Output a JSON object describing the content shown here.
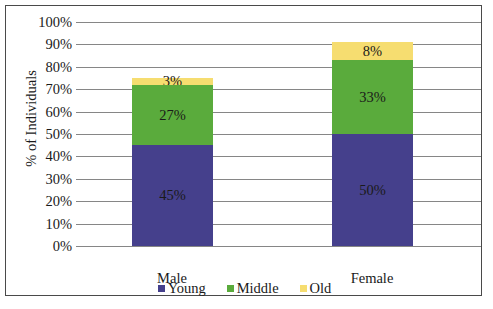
{
  "chart_data": {
    "type": "bar",
    "subtype": "stacked-column-100",
    "title": "",
    "xlabel": "",
    "ylabel": "% of Individuals",
    "categories": [
      "Male",
      "Female"
    ],
    "series": [
      {
        "name": "Young",
        "color": "#45408c",
        "values": [
          45,
          50
        ],
        "labels": [
          "45%",
          "50%"
        ]
      },
      {
        "name": "Middle",
        "color": "#5aab3c",
        "values": [
          27,
          33
        ],
        "labels": [
          "27%",
          "33%"
        ]
      },
      {
        "name": "Old",
        "color": "#f6dd70",
        "values": [
          3,
          8
        ],
        "labels": [
          "3%",
          "8%"
        ]
      }
    ],
    "ylim": [
      0,
      100
    ],
    "ytick_values": [
      0,
      10,
      20,
      30,
      40,
      50,
      60,
      70,
      80,
      90,
      100
    ],
    "ytick_labels": [
      "0%",
      "10%",
      "20%",
      "30%",
      "40%",
      "50%",
      "60%",
      "70%",
      "80%",
      "90%",
      "100%"
    ],
    "grid": true,
    "legend_position": "bottom",
    "totals": [
      75,
      91
    ]
  },
  "axis": {
    "y_title": "% of Individuals"
  },
  "legend": {
    "items": [
      {
        "label": "Young",
        "color": "#45408c"
      },
      {
        "label": "Middle",
        "color": "#5aab3c"
      },
      {
        "label": "Old",
        "color": "#f6dd70"
      }
    ]
  },
  "colors": {
    "young": "#45408c",
    "middle": "#5aab3c",
    "old": "#f6dd70",
    "gridline": "#868686",
    "border": "#4a4a4a",
    "background": "#ffffff",
    "text": "#1a1a1a"
  }
}
